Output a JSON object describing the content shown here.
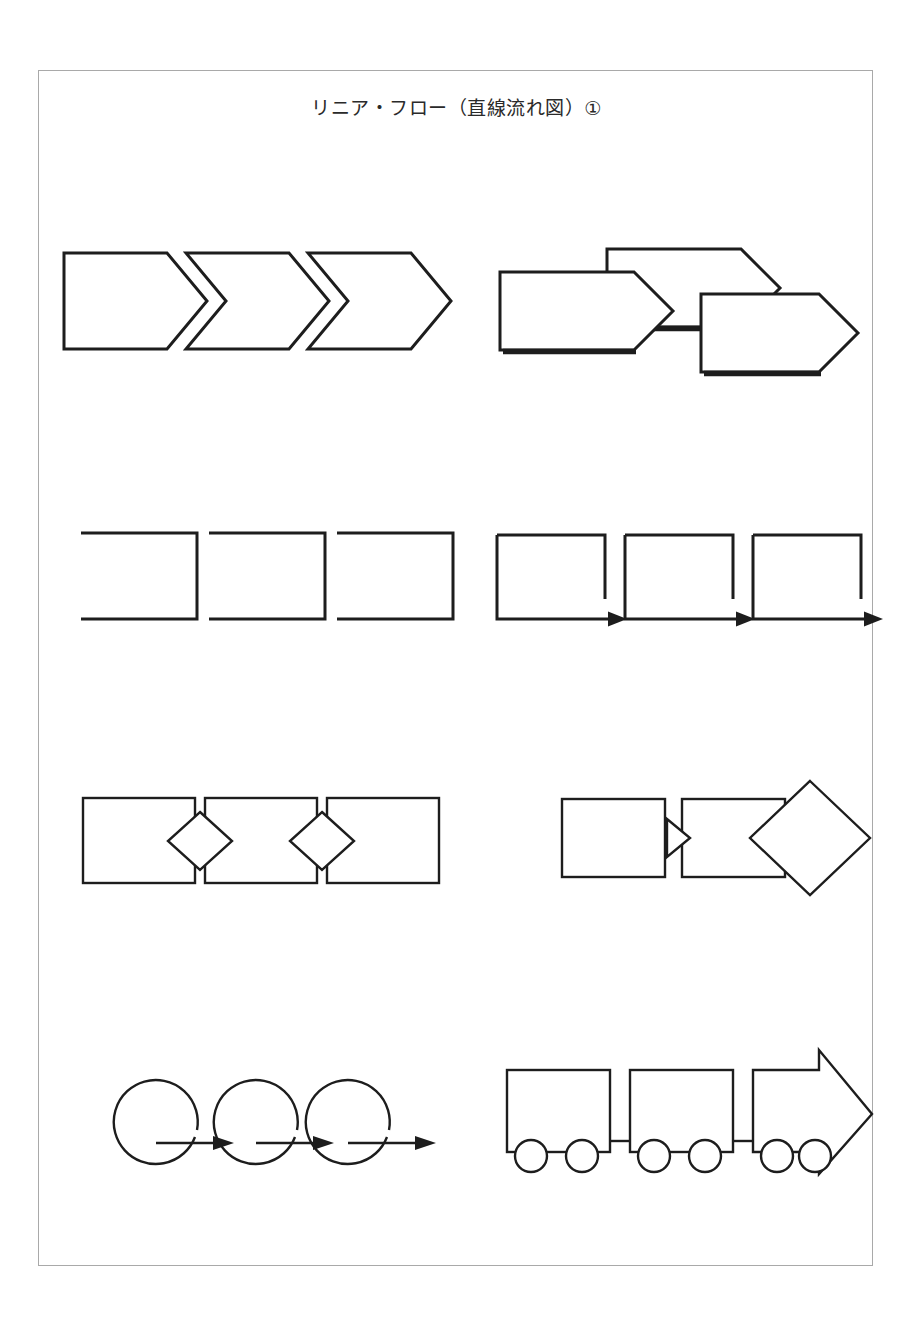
{
  "page": {
    "title": "リニア・フロー（直線流れ図）①",
    "background_color": "#ffffff",
    "frame_color": "#a9a9a9",
    "ink_color": "#1d1d1d",
    "width": 918,
    "height": 1327
  },
  "diagrams": [
    {
      "id": "chevron-chain",
      "label": "シェブロン連結（3連）",
      "row": 1,
      "column": "left",
      "shape_count": 3,
      "shape_kind": "chevron-arrow",
      "style": "interlocking notched chevrons, open outline"
    },
    {
      "id": "stacked-pentagon-arrows",
      "label": "段違い五角形矢印（3連）",
      "row": 1,
      "column": "right",
      "shape_count": 3,
      "shape_kind": "pentagon-arrow",
      "style": "overlapping descending staircase with drop shadow edge"
    },
    {
      "id": "open-bracket-chain",
      "label": "開いた括弧（3連）",
      "row": 2,
      "column": "left",
      "shape_count": 3,
      "shape_kind": "bracket-open-left",
      "style": "three-sided rectangles open on the left"
    },
    {
      "id": "bracket-arrow-chain",
      "label": "括弧＋矢印（3連）",
      "row": 2,
      "column": "right",
      "shape_count": 3,
      "shape_kind": "bracket-with-arrow",
      "style": "three-sided rectangles with arrow extending from base"
    },
    {
      "id": "rect-diamond-chain",
      "label": "四角形＋菱形ジョイント（3連）",
      "row": 3,
      "column": "left",
      "shape_count": 3,
      "connector_count": 2,
      "shape_kind": "rectangle",
      "connector_kind": "diamond",
      "style": "rectangles joined by small diamonds"
    },
    {
      "id": "rect-triangle-diamond",
      "label": "四角形＋三角ジョイント＋大菱形",
      "row": 3,
      "column": "right",
      "shape_count": 2,
      "connector_count": 1,
      "shape_kind": "rectangle",
      "connector_kind": "triangle",
      "extra_shape": "large-diamond",
      "style": "two rectangles joined by a triangle, followed by a large diamond"
    },
    {
      "id": "circle-loop-arrows",
      "label": "円ループ＋矢印（3連）",
      "row": 4,
      "column": "left",
      "shape_count": 3,
      "shape_kind": "open-circle-loop",
      "arrow_count": 3,
      "style": "open circles whose tails continue into rightward arrows"
    },
    {
      "id": "train-arrow",
      "label": "列車型（貨車2＋矢印先頭）",
      "row": 4,
      "column": "right",
      "car_count": 3,
      "wheels_per_car": 2,
      "shape_kind": "train-cars",
      "head_shape": "arrow",
      "style": "two boxcars and an arrow-shaped lead car, each on two wheels"
    }
  ]
}
